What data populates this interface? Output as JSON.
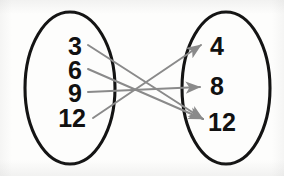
{
  "diagram": {
    "type": "mapping-diagram",
    "domain_set": {
      "name": "domain",
      "shape": "ellipse",
      "elements": [
        {
          "label": "3",
          "x": 82,
          "y": 48
        },
        {
          "label": "6",
          "x": 82,
          "y": 72
        },
        {
          "label": "9",
          "x": 82,
          "y": 95
        },
        {
          "label": "12",
          "x": 82,
          "y": 120
        }
      ]
    },
    "range_set": {
      "name": "range",
      "shape": "ellipse",
      "elements": [
        {
          "label": "4",
          "x": 218,
          "y": 48
        },
        {
          "label": "8",
          "x": 218,
          "y": 88
        },
        {
          "label": "12",
          "x": 218,
          "y": 124
        }
      ]
    },
    "mappings": [
      {
        "from": "3",
        "to": "12",
        "x1": 88,
        "y1": 45,
        "x2": 203,
        "y2": 119
      },
      {
        "from": "6",
        "to": "12",
        "x1": 88,
        "y1": 69,
        "x2": 203,
        "y2": 119
      },
      {
        "from": "9",
        "to": "8",
        "x1": 88,
        "y1": 92,
        "x2": 200,
        "y2": 87
      },
      {
        "from": "12",
        "to": "4",
        "x1": 93,
        "y1": 118,
        "x2": 201,
        "y2": 45
      }
    ],
    "colors": {
      "ellipse_stroke": "#141414",
      "arrow": "#8a8a8a",
      "text": "#111111",
      "background": "#fdfdfc"
    }
  }
}
